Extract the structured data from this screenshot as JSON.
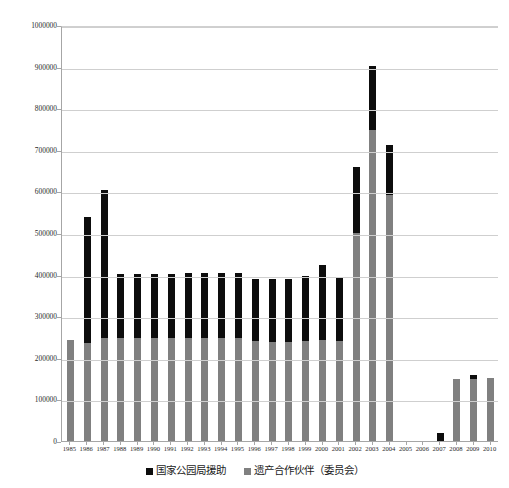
{
  "chart_data": {
    "type": "bar",
    "subtype": "stacked",
    "title": "",
    "xlabel": "",
    "ylabel": "",
    "ylim": [
      0,
      1000000
    ],
    "ytick_step": 100000,
    "yticks": [
      "0",
      "100000",
      "200000",
      "300000",
      "400000",
      "500000",
      "600000",
      "700000",
      "800000",
      "900000",
      "1000000"
    ],
    "grid": true,
    "legend_position": "bottom",
    "categories": [
      "1985",
      "1986",
      "1987",
      "1988",
      "1989",
      "1990",
      "1991",
      "1992",
      "1993",
      "1994",
      "1995",
      "1996",
      "1997",
      "1998",
      "1999",
      "2000",
      "2001",
      "2002",
      "2003",
      "2004",
      "2005",
      "2006",
      "2007",
      "2008",
      "2009",
      "2010"
    ],
    "series": [
      {
        "name": "遗产合作伙伴（委员会）",
        "color": "#808080",
        "values": [
          243000,
          236000,
          248000,
          248000,
          248000,
          248000,
          248000,
          248000,
          248000,
          248000,
          248000,
          240000,
          239000,
          239000,
          241000,
          243000,
          241000,
          500000,
          748000,
          591000,
          0,
          0,
          0,
          149000,
          149000,
          152000
        ]
      },
      {
        "name": "国家公园局援助",
        "color": "#0d0d0d",
        "values": [
          0,
          302000,
          355000,
          153000,
          153000,
          153000,
          153000,
          156000,
          157000,
          157000,
          157000,
          150000,
          151000,
          151000,
          156000,
          181000,
          152000,
          159000,
          153000,
          121000,
          0,
          0,
          20000,
          0,
          10000,
          0
        ]
      }
    ],
    "totals": [
      243000,
      538000,
      603000,
      401000,
      401000,
      401000,
      401000,
      404000,
      405000,
      405000,
      405000,
      390000,
      390000,
      390000,
      397000,
      424000,
      393000,
      659000,
      901000,
      712000,
      0,
      0,
      20000,
      149000,
      159000,
      152000
    ]
  },
  "legend": {
    "items": [
      {
        "label": "国家公园局援助",
        "color": "#0d0d0d"
      },
      {
        "label": "遗产合作伙伴（委员会）",
        "color": "#808080"
      }
    ]
  }
}
